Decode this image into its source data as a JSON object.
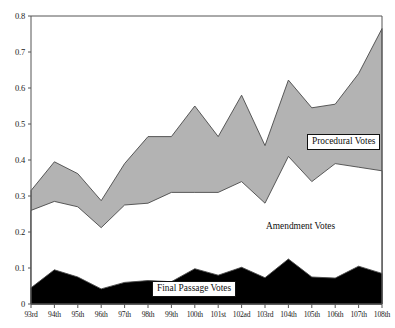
{
  "chart_data": {
    "type": "area",
    "stacked": true,
    "title": "",
    "xlabel": "",
    "ylabel": "",
    "ylim": [
      0,
      0.8
    ],
    "yticks": [
      "0",
      "0.1",
      "0.2",
      "0.3",
      "0.4",
      "0.5",
      "0.6",
      "0.7",
      "0.8"
    ],
    "ytick_values": [
      0,
      0.1,
      0.2,
      0.3,
      0.4,
      0.5,
      0.6,
      0.7,
      0.8
    ],
    "grid": false,
    "legend_position": "inline-annotations",
    "categories": [
      "93rd",
      "94th",
      "95th",
      "96th",
      "97th",
      "98th",
      "99th",
      "100th",
      "101st",
      "102ad",
      "103rd",
      "104th",
      "105th",
      "106th",
      "107th",
      "108th"
    ],
    "series": [
      {
        "name": "Final Passage Votes",
        "color": "#000000",
        "values": [
          0.045,
          0.095,
          0.075,
          0.042,
          0.06,
          0.065,
          0.062,
          0.098,
          0.08,
          0.102,
          0.073,
          0.125,
          0.075,
          0.072,
          0.105,
          0.085
        ]
      },
      {
        "name": "Amendment Votes",
        "color": "#ffffff",
        "values": [
          0.215,
          0.19,
          0.195,
          0.17,
          0.215,
          0.215,
          0.248,
          0.212,
          0.23,
          0.238,
          0.207,
          0.285,
          0.265,
          0.318,
          0.275,
          0.285
        ]
      },
      {
        "name": "Procedural Votes",
        "color": "#b3b3b3",
        "values": [
          0.055,
          0.11,
          0.092,
          0.075,
          0.115,
          0.185,
          0.155,
          0.24,
          0.155,
          0.24,
          0.16,
          0.212,
          0.205,
          0.165,
          0.26,
          0.395
        ]
      }
    ],
    "cumulative_tops": {
      "final_passage": [
        0.045,
        0.095,
        0.075,
        0.042,
        0.06,
        0.065,
        0.062,
        0.098,
        0.08,
        0.102,
        0.073,
        0.125,
        0.075,
        0.072,
        0.105,
        0.085
      ],
      "amendment": [
        0.26,
        0.285,
        0.27,
        0.212,
        0.275,
        0.28,
        0.31,
        0.31,
        0.31,
        0.34,
        0.28,
        0.41,
        0.34,
        0.39,
        0.38,
        0.37
      ],
      "procedural": [
        0.315,
        0.395,
        0.362,
        0.287,
        0.39,
        0.465,
        0.465,
        0.55,
        0.465,
        0.58,
        0.44,
        0.622,
        0.545,
        0.555,
        0.64,
        0.765
      ]
    },
    "annotations": [
      {
        "name": "procedural-votes-label",
        "text": "Procedural Votes",
        "boxed": true
      },
      {
        "name": "amendment-votes-label",
        "text": "Amendment Votes",
        "boxed": false
      },
      {
        "name": "final-passage-votes-label",
        "text": "Final Passage Votes",
        "boxed": true
      }
    ]
  },
  "axes": {
    "y_ticks": [
      "0.8",
      "0.7",
      "0.6",
      "0.5",
      "0.4",
      "0.3",
      "0.2",
      "0.1",
      "0"
    ],
    "x_ticks": [
      "93rd",
      "94th",
      "95th",
      "96th",
      "97th",
      "98th",
      "99th",
      "100th",
      "101st",
      "102ad",
      "103rd",
      "104th",
      "105th",
      "106th",
      "107th",
      "108th"
    ]
  },
  "labels": {
    "procedural": "Procedural Votes",
    "amendment": "Amendment Votes",
    "final_passage": "Final Passage Votes"
  },
  "colors": {
    "procedural_fill": "#b3b3b3",
    "amendment_fill": "#ffffff",
    "final_passage_fill": "#000000",
    "axis": "#555555",
    "outline": "#4a4a4a"
  }
}
